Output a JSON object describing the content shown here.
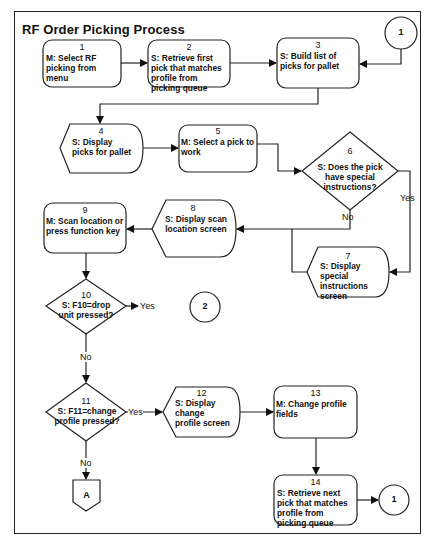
{
  "title": "RF Order Picking Process",
  "nodes": [
    {
      "id": "1",
      "shape": "rounded-rect",
      "text": "M: Select RF picking from menu"
    },
    {
      "id": "2",
      "shape": "rounded-rect",
      "text": "S: Retrieve first pick that matches profile from picking queue"
    },
    {
      "id": "3",
      "shape": "rounded-rect",
      "text": "S: Build list of picks for pallet"
    },
    {
      "id": "4",
      "shape": "display",
      "text": "S: Display picks for pallet"
    },
    {
      "id": "5",
      "shape": "rounded-rect",
      "text": "M: Select a pick to work"
    },
    {
      "id": "6",
      "shape": "diamond",
      "text": "S: Does the pick have special instructions?"
    },
    {
      "id": "7",
      "shape": "display",
      "text": "S: Display special instructions screen"
    },
    {
      "id": "8",
      "shape": "display",
      "text": "S: Display scan location screen"
    },
    {
      "id": "9",
      "shape": "rounded-rect",
      "text": "M: Scan location or press function key"
    },
    {
      "id": "10",
      "shape": "diamond",
      "text": "S: F10=drop unit pressed?"
    },
    {
      "id": "11",
      "shape": "diamond",
      "text": "S: F11=change profile pressed?"
    },
    {
      "id": "12",
      "shape": "display",
      "text": "S: Display change profile screen"
    },
    {
      "id": "13",
      "shape": "rounded-rect",
      "text": "M: Change profile fields"
    },
    {
      "id": "14",
      "shape": "rounded-rect",
      "text": "S: Retrieve next pick that matches profile from picking queue"
    }
  ],
  "connectors": {
    "c1_top": "1",
    "c2": "2",
    "c1_bottom": "1",
    "offpage_a": "A"
  },
  "edge_labels": {
    "yes_6": "Yes",
    "no_6": "No",
    "yes_10": "Yes",
    "no_10": "No",
    "yes_11": "Yes",
    "no_11": "No"
  },
  "edges": [
    {
      "from": "1",
      "to": "2"
    },
    {
      "from": "2",
      "to": "3"
    },
    {
      "from": "c1_top",
      "to": "3"
    },
    {
      "from": "3",
      "to": "4"
    },
    {
      "from": "4",
      "to": "5"
    },
    {
      "from": "5",
      "to": "6"
    },
    {
      "from": "6",
      "to": "7",
      "label": "Yes"
    },
    {
      "from": "6",
      "to": "8",
      "label": "No"
    },
    {
      "from": "7",
      "to": "8"
    },
    {
      "from": "8",
      "to": "9"
    },
    {
      "from": "9",
      "to": "10"
    },
    {
      "from": "10",
      "to": "c2",
      "label": "Yes"
    },
    {
      "from": "10",
      "to": "11",
      "label": "No"
    },
    {
      "from": "11",
      "to": "12",
      "label": "Yes"
    },
    {
      "from": "11",
      "to": "A",
      "label": "No"
    },
    {
      "from": "12",
      "to": "13"
    },
    {
      "from": "13",
      "to": "14"
    },
    {
      "from": "14",
      "to": "c1_bottom"
    }
  ]
}
